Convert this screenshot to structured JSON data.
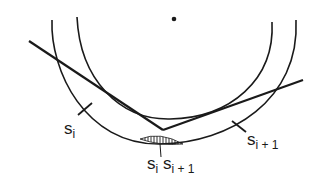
{
  "diagram": {
    "colors": {
      "stroke": "#1a1a1a",
      "background": "#ffffff"
    },
    "center_point": {
      "cx": 174,
      "cy": 19,
      "r": 2.3
    },
    "outer_arc": {
      "path": "M52,20 C50,70 85,145 160,144 C230,143 300,100 296,20"
    },
    "inner_arc": {
      "path": "M77,17 C80,80 120,120 170,119 C230,118 275,80 272,22"
    },
    "line_a": {
      "x1": 29,
      "y1": 41,
      "x2": 163,
      "y2": 130
    },
    "line_b": {
      "x1": 163,
      "y1": 130,
      "x2": 303,
      "y2": 80
    },
    "hatched_region": {
      "path": "M140,139 Q160,131 183,144 Q160,146 140,139 Z"
    },
    "tick_marks": [
      {
        "x1": 78,
        "y1": 115,
        "x2": 92,
        "y2": 103
      },
      {
        "x1": 232,
        "y1": 121,
        "x2": 246,
        "y2": 132
      },
      {
        "x1": 160,
        "y1": 144,
        "x2": 161,
        "y2": 157
      }
    ],
    "labels": {
      "s_i": {
        "base": "s",
        "sub": "i"
      },
      "s_i_plus_1": {
        "base": "s",
        "sub": "i + 1"
      },
      "s_i_s_i_plus_1": {
        "base1": "s",
        "sub1": "i",
        "base2": " s",
        "sub2": "i + 1"
      }
    }
  }
}
